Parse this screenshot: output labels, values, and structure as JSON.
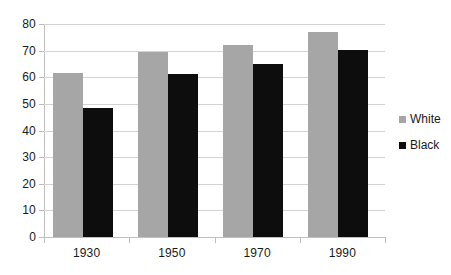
{
  "chart_data": {
    "type": "bar",
    "title": "",
    "subtitle": "",
    "xlabel": "",
    "ylabel": "",
    "categories": [
      "1930",
      "1950",
      "1970",
      "1990"
    ],
    "series": [
      {
        "name": "White",
        "color": "#a6a6a6",
        "values": [
          61.5,
          69.5,
          72.2,
          77.0
        ]
      },
      {
        "name": "Black",
        "color": "#0d0d0d",
        "values": [
          48.5,
          61.4,
          65.0,
          70.2
        ]
      }
    ],
    "ylim": [
      0,
      80
    ],
    "ytick_step": 10,
    "yticks": [
      "0",
      "10",
      "20",
      "30",
      "40",
      "50",
      "60",
      "70",
      "80"
    ],
    "grid": "horizontal",
    "legend_position": "right"
  },
  "legend": {
    "items": [
      {
        "label": "White",
        "swatch": "gray-square-icon"
      },
      {
        "label": "Black",
        "swatch": "black-square-icon"
      }
    ]
  }
}
